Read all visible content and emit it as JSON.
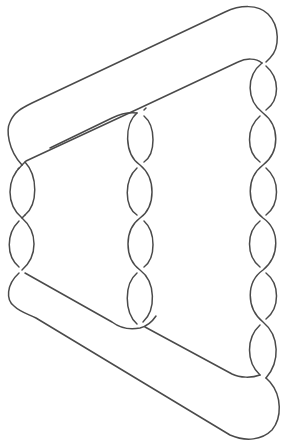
{
  "diagram": {
    "type": "knot-diagram",
    "stroke_color": "#4a4a4a",
    "background_color": "#ffffff",
    "columns": [
      {
        "name": "left",
        "center_x": 22,
        "crossings_y": [
          165,
          218,
          270
        ]
      },
      {
        "name": "middle",
        "center_x": 142,
        "crossings_y": [
          113,
          165,
          218,
          270,
          322
        ]
      },
      {
        "name": "right",
        "center_x": 263,
        "crossings_y": [
          63,
          113,
          165,
          218,
          270,
          322,
          375
        ]
      }
    ],
    "crossing_count": 15
  }
}
